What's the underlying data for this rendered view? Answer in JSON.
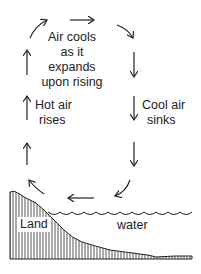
{
  "diagram": {
    "type": "sea-breeze convection cycle",
    "labels": {
      "top": [
        "Air cools",
        "as it expands",
        "upon rising"
      ],
      "left": [
        "Hot air",
        "rises"
      ],
      "right": [
        "Cool air",
        "sinks"
      ],
      "land": "Land",
      "water": "water"
    },
    "arrows": [
      {
        "id": "up-lower-left",
        "direction": "up"
      },
      {
        "id": "up-middle-left",
        "direction": "up"
      },
      {
        "id": "up-upper-left",
        "direction": "up"
      },
      {
        "id": "curve-top-left",
        "direction": "up-right"
      },
      {
        "id": "top-right",
        "direction": "right"
      },
      {
        "id": "curve-top-right",
        "direction": "down-right"
      },
      {
        "id": "down-upper-right",
        "direction": "down"
      },
      {
        "id": "down-middle-right",
        "direction": "down"
      },
      {
        "id": "down-lower-right",
        "direction": "down"
      },
      {
        "id": "curve-bottom-right",
        "direction": "down-left"
      },
      {
        "id": "left-bottom",
        "direction": "left"
      },
      {
        "id": "curve-bottom-left",
        "direction": "up-left"
      }
    ],
    "colors": {
      "line": "#222222",
      "background": "#ffffff"
    }
  }
}
